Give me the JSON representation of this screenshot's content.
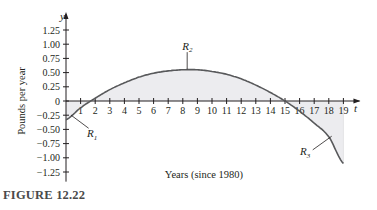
{
  "figure": {
    "caption": "FIGURE 12.22"
  },
  "chart_data": {
    "type": "line",
    "title": "",
    "xlabel": "Years (since 1980)",
    "ylabel": "Pounds per year",
    "x_axis_symbol": "t",
    "y_axis_symbol": "y",
    "x_ticks": [
      1,
      2,
      3,
      4,
      5,
      6,
      7,
      8,
      9,
      10,
      11,
      12,
      13,
      14,
      15,
      16,
      17,
      18,
      19
    ],
    "y_ticks": [
      1.25,
      1.0,
      0.75,
      0.5,
      0.25,
      0,
      -0.25,
      -0.5,
      -0.75,
      -1.0,
      -1.25
    ],
    "y_tick_labels": [
      "1.25",
      "1.00",
      "0.75",
      "0.50",
      "0.25",
      "0",
      "−0.25",
      "−0.50",
      "−0.75",
      "−1.00",
      "−1.25"
    ],
    "xlim": [
      0,
      19.5
    ],
    "ylim": [
      -1.4,
      1.35
    ],
    "grid": false,
    "legend": null,
    "series": [
      {
        "name": "curve",
        "x": [
          0,
          1,
          2,
          3,
          4,
          5,
          6,
          7,
          8,
          9,
          10,
          11,
          12,
          13,
          14,
          15,
          16,
          17,
          18,
          19
        ],
        "values": [
          -0.33,
          -0.12,
          0.05,
          0.2,
          0.32,
          0.42,
          0.49,
          0.53,
          0.55,
          0.55,
          0.52,
          0.47,
          0.39,
          0.28,
          0.15,
          0.0,
          -0.18,
          -0.39,
          -0.63,
          -1.1
        ]
      }
    ],
    "shaded_regions": [
      {
        "label": "R₁",
        "t_range": [
          0,
          1.7
        ],
        "sign": "negative"
      },
      {
        "label": "R₂",
        "t_range": [
          1.7,
          15
        ],
        "sign": "positive"
      },
      {
        "label": "R₃",
        "t_range": [
          15,
          19
        ],
        "sign": "negative"
      }
    ],
    "annotations": [
      "R1",
      "R2",
      "R3"
    ]
  }
}
